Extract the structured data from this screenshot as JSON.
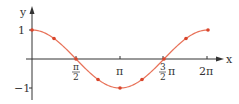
{
  "chart_data": {
    "type": "line",
    "title": "",
    "xlabel": "x",
    "ylabel": "y",
    "function": "cos(x)",
    "x_ticks": [
      {
        "value": 1.5708,
        "label": "π/2"
      },
      {
        "value": 3.1416,
        "label": "π"
      },
      {
        "value": 4.7124,
        "label": "3/2 π"
      },
      {
        "value": 6.2832,
        "label": "2π"
      }
    ],
    "y_ticks": [
      {
        "value": 1,
        "label": "1"
      },
      {
        "value": -1,
        "label": "−1"
      }
    ],
    "xlim": [
      0,
      6.55
    ],
    "ylim": [
      -1.45,
      1.5
    ],
    "grid": false,
    "legend": null,
    "series": [
      {
        "name": "cos x",
        "color": "#e8735a",
        "marker_color": "#d9452b",
        "x": [
          0,
          0.7854,
          1.5708,
          2.3562,
          3.1416,
          3.927,
          4.7124,
          5.4978,
          6.2832
        ],
        "y": [
          1,
          0.707,
          0,
          -0.707,
          -1,
          -0.707,
          0,
          0.707,
          1
        ]
      }
    ]
  },
  "labels": {
    "x_axis": "x",
    "y_axis": "y",
    "y_one": "1",
    "y_minus_one": "−1",
    "pi_half_num": "π",
    "pi_half_den": "2",
    "pi": "π",
    "three_half_num": "3",
    "three_half_den": "2",
    "three_half_pi": "π",
    "two_pi": "2π"
  },
  "colors": {
    "axis": "#333333",
    "curve": "#e8735a",
    "marker": "#d9452b"
  }
}
